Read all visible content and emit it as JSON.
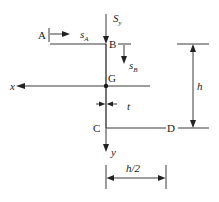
{
  "diagram": {
    "points": {
      "A": "A",
      "B": "B",
      "G": "G",
      "C": "C",
      "D": "D"
    },
    "force": {
      "symbol": "S",
      "subscript": "y"
    },
    "shear_flow_coords": {
      "sA": {
        "symbol": "s",
        "subscript": "A"
      },
      "sB": {
        "symbol": "s",
        "subscript": "B"
      }
    },
    "axes": {
      "x": "x",
      "y": "y"
    },
    "dimensions": {
      "thickness": "t",
      "height": "h",
      "flange_width": "h/2"
    },
    "colors": {
      "line": "#3a3a3a",
      "text": "#222222",
      "background": "#ffffff"
    }
  }
}
